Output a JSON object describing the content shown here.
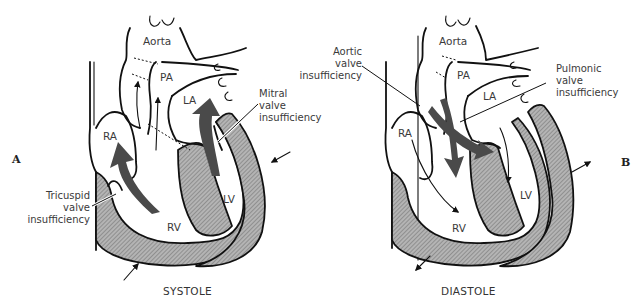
{
  "figure": {
    "panels": [
      {
        "id": "A",
        "letter": "A",
        "caption": "SYSTOLE",
        "chambers": {
          "aorta": "Aorta",
          "pa": "PA",
          "la": "LA",
          "ra": "RA",
          "lv": "LV",
          "rv": "RV"
        },
        "annotations": {
          "mitral": [
            "Mitral",
            "valve",
            "insufficiency"
          ],
          "tricuspid": [
            "Tricuspid",
            "valve",
            "insufficiency"
          ]
        }
      },
      {
        "id": "B",
        "letter": "B",
        "caption": "DIASTOLE",
        "chambers": {
          "aorta": "Aorta",
          "pa": "PA",
          "la": "LA",
          "ra": "RA",
          "lv": "LV",
          "rv": "RV"
        },
        "annotations": {
          "aortic": [
            "Aortic",
            "valve",
            "insufficiency"
          ],
          "pulmonic": [
            "Pulmonic",
            "valve",
            "insufficiency"
          ]
        }
      }
    ],
    "colors": {
      "muscle_fill": "#9c9c9c",
      "flow_arrow": "#4a4a4a",
      "outline": "#111111",
      "background": "#ffffff"
    }
  }
}
